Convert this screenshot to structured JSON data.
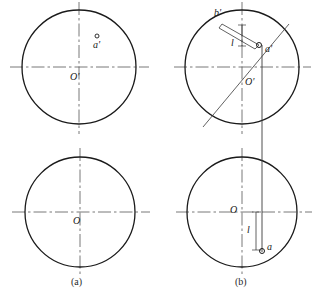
{
  "figure": {
    "stroke_color": "#1a1a1a",
    "centerline_color": "#555555",
    "thin_color": "#4a4a4a",
    "background": "#ffffff"
  },
  "panels": [
    {
      "id": "a",
      "caption": "(a)",
      "caption_pos": {
        "x": 78,
        "y": 278
      },
      "views": [
        {
          "name": "front-view",
          "circle": {
            "cx": 79,
            "cy": 67,
            "r": 57
          },
          "center_label": {
            "text": "O'",
            "x": 72,
            "y": 78
          },
          "points": [
            {
              "text": "a'",
              "x": 94,
              "y": 45,
              "marker": {
                "cx": 97,
                "cy": 36,
                "r": 2
              }
            }
          ]
        },
        {
          "name": "top-view",
          "circle": {
            "cx": 80,
            "cy": 212,
            "r": 55
          },
          "center_label": {
            "text": "O",
            "x": 74,
            "y": 222
          },
          "points": []
        }
      ]
    },
    {
      "id": "b",
      "caption": "(b)",
      "caption_pos": {
        "x": 242,
        "y": 278
      },
      "views": [
        {
          "name": "front-view",
          "circle": {
            "cx": 242,
            "cy": 67,
            "r": 57
          },
          "center_label": {
            "text": "O'",
            "x": 246,
            "y": 83
          },
          "points": [
            {
              "text": "b'",
              "x": 216,
              "y": 14,
              "marker": null
            },
            {
              "text": "a'",
              "x": 267,
              "y": 50,
              "marker": {
                "cx": 259,
                "cy": 45,
                "r": 2.5
              }
            }
          ],
          "dimension_label": {
            "text": "l",
            "x": 233,
            "y": 44
          }
        },
        {
          "name": "top-view",
          "circle": {
            "cx": 242,
            "cy": 212,
            "r": 55
          },
          "center_label": {
            "text": "O",
            "x": 232,
            "y": 220
          },
          "points": [
            {
              "text": "a",
              "x": 268,
              "y": 248,
              "marker": {
                "cx": 262,
                "cy": 250,
                "r": 2.5
              }
            }
          ],
          "dimension_label": {
            "text": "l",
            "x": 252,
            "y": 232
          }
        }
      ]
    }
  ],
  "construction": {
    "diagonal_chord": {
      "x1": 203,
      "y1": 127,
      "x2": 289,
      "y2": 24
    },
    "parallelogram": [
      {
        "x": 222,
        "y": 24
      },
      {
        "x": 259,
        "y": 45
      },
      {
        "x": 255,
        "y": 49
      },
      {
        "x": 219,
        "y": 28
      }
    ],
    "projection_line": {
      "x": 262,
      "y1": 45,
      "y2": 252
    },
    "brace_upper": {
      "x": 242,
      "y1": 24,
      "y2": 45
    },
    "brace_lower": {
      "x": 262,
      "y1": 212,
      "y2": 250
    }
  }
}
